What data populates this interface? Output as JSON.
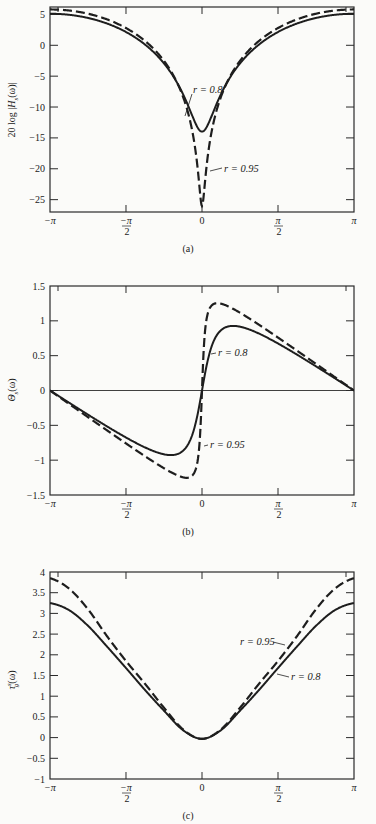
{
  "chart_data": [
    {
      "type": "line",
      "panel": "(a)",
      "title": "",
      "caption": "(a)",
      "xlabel": "",
      "ylabel": "20 log |H_s(ω)|",
      "ylabel_parts": {
        "pre": "20 log |",
        "main": "H",
        "sub": "s",
        "post": "(ω)|"
      },
      "xlim": [
        -3.14159,
        3.14159
      ],
      "ylim": [
        -27,
        6.2
      ],
      "xticks": [
        {
          "v": -3.14159,
          "label": "−π"
        },
        {
          "v": -1.5708,
          "label": "−π/2"
        },
        {
          "v": 0,
          "label": "0"
        },
        {
          "v": 1.5708,
          "label": "π/2"
        },
        {
          "v": 3.14159,
          "label": "π"
        }
      ],
      "yticks": [
        5,
        0,
        -5,
        -10,
        -15,
        -20,
        -25
      ],
      "ytick_labels": [
        "5",
        "0",
        "−5",
        "−10",
        "−15",
        "−20",
        "−25"
      ],
      "grid": false,
      "x": [
        "−π",
        "−7π/8",
        "−3π/4",
        "−5π/8",
        "−π/2",
        "−3π/8",
        "−π/4",
        "−π/8",
        "0",
        "π/8",
        "π/4",
        "3π/8",
        "π/2",
        "5π/8",
        "3π/4",
        "7π/8",
        "π"
      ],
      "series": [
        {
          "name": "r = 0.8",
          "style": "solid",
          "r": 0.8,
          "values": [
            5.11,
            4.94,
            4.43,
            3.53,
            2.15,
            0.12,
            -2.93,
            -7.9,
            -13.98,
            -7.9,
            -2.93,
            0.12,
            2.15,
            3.53,
            4.43,
            4.94,
            5.11
          ]
        },
        {
          "name": "r = 0.95",
          "style": "dashed",
          "r": 0.95,
          "values": [
            5.8,
            5.63,
            5.11,
            4.2,
            2.79,
            0.7,
            -2.53,
            -8.33,
            -26.02,
            -8.33,
            -2.53,
            0.7,
            2.79,
            4.2,
            5.11,
            5.63,
            5.8
          ]
        }
      ],
      "annotations": [
        {
          "text": "r = 0.8",
          "x": 193,
          "y": 93,
          "lx1": 192,
          "ly1": 94,
          "lx2": 185,
          "ly2": 116
        },
        {
          "text": "r = 0.95",
          "x": 224,
          "y": 172,
          "lx1": 222,
          "ly1": 168,
          "lx2": 210,
          "ly2": 171
        }
      ]
    },
    {
      "type": "line",
      "panel": "(b)",
      "title": "",
      "caption": "(b)",
      "xlabel": "",
      "ylabel": "Θ_s(ω)",
      "ylabel_parts": {
        "pre": "",
        "main": "Θ",
        "sub": "s",
        "post": "(ω)"
      },
      "xlim": [
        -3.14159,
        3.14159
      ],
      "ylim": [
        -1.5,
        1.5
      ],
      "xticks": [
        {
          "v": -3.14159,
          "label": "−π"
        },
        {
          "v": -1.5708,
          "label": "−π/2"
        },
        {
          "v": 0,
          "label": "0"
        },
        {
          "v": 1.5708,
          "label": "π/2"
        },
        {
          "v": 3.14159,
          "label": "π"
        }
      ],
      "yticks": [
        1.5,
        1,
        0.5,
        0,
        -0.5,
        -1,
        -1.5
      ],
      "ytick_labels": [
        "1.5",
        "1",
        "0.5",
        "0",
        "−0.5",
        "−1",
        "−1.5"
      ],
      "zero_line": true,
      "grid": false,
      "x": [
        "−π",
        "−7π/8",
        "−3π/4",
        "−5π/8",
        "−π/2",
        "−3π/8",
        "−π/4",
        "−π/8",
        "0",
        "π/8",
        "π/4",
        "3π/8",
        "π/2",
        "5π/8",
        "3π/4",
        "7π/8",
        "π"
      ],
      "series": [
        {
          "name": "r = 0.8",
          "style": "solid",
          "r": 0.8,
          "values": [
            0,
            -0.174,
            -0.347,
            -0.515,
            -0.675,
            -0.817,
            -0.916,
            -0.865,
            0,
            0.865,
            0.916,
            0.817,
            0.675,
            0.515,
            0.347,
            0.174,
            0
          ]
        },
        {
          "name": "r = 0.95",
          "style": "dashed",
          "r": 0.95,
          "values": [
            0,
            -0.191,
            -0.382,
            -0.572,
            -0.76,
            -0.944,
            -1.116,
            -1.246,
            0,
            1.246,
            1.116,
            0.944,
            0.76,
            0.572,
            0.382,
            0.191,
            0
          ]
        }
      ],
      "annotations": [
        {
          "text": "r = 0.8",
          "x": 218,
          "y": 356,
          "lx1": 216,
          "ly1": 353,
          "lx2": 211,
          "ly2": 354
        },
        {
          "text": "r = 0.95",
          "x": 210,
          "y": 448,
          "lx1": 208,
          "ly1": 445,
          "lx2": 204,
          "ly2": 446
        }
      ]
    },
    {
      "type": "line",
      "panel": "(c)",
      "title": "",
      "caption": "(c)",
      "xlabel": "",
      "ylabel": "τ_g^s(ω)",
      "ylabel_parts": {
        "pre": "",
        "main": "τ",
        "sub": "g",
        "sup": "s",
        "post": "(ω)"
      },
      "xlim": [
        -3.14159,
        3.14159
      ],
      "ylim": [
        -1,
        4
      ],
      "xticks": [
        {
          "v": -3.14159,
          "label": "−π"
        },
        {
          "v": -1.5708,
          "label": "−π/2"
        },
        {
          "v": 0,
          "label": "0"
        },
        {
          "v": 1.5708,
          "label": "π/2"
        },
        {
          "v": 3.14159,
          "label": "π"
        }
      ],
      "yticks": [
        4,
        3.5,
        3,
        2.5,
        2,
        1.5,
        1,
        0.5,
        0,
        -0.5,
        -1
      ],
      "ytick_labels": [
        "4",
        "3.5",
        "3",
        "2.5",
        "2",
        "1.5",
        "1",
        "0.5",
        "0",
        "−0.5",
        "−1"
      ],
      "grid": false,
      "x": [
        "−π",
        "−7π/8",
        "−3π/4",
        "−5π/8",
        "−π/2",
        "−3π/8",
        "−π/4",
        "−π/8",
        "0",
        "π/8",
        "π/4",
        "3π/8",
        "π/2",
        "5π/8",
        "3π/4",
        "7π/8",
        "π"
      ],
      "series": [
        {
          "name": "r = 0.8",
          "style": "solid",
          "r": 0.8,
          "values": [
            3.25,
            3.08,
            2.7,
            2.2,
            1.68,
            1.15,
            0.65,
            0.18,
            -0.03,
            0.18,
            0.65,
            1.15,
            1.68,
            2.2,
            2.7,
            3.08,
            3.25
          ]
        },
        {
          "name": "r = 0.95",
          "style": "dashed",
          "r": 0.95,
          "values": [
            3.85,
            3.6,
            3.1,
            2.45,
            1.85,
            1.3,
            0.72,
            0.2,
            -0.03,
            0.2,
            0.72,
            1.3,
            1.85,
            2.45,
            3.1,
            3.6,
            3.85
          ]
        }
      ],
      "annotations": [
        {
          "text": "r = 0.95",
          "x": 240,
          "y": 645,
          "lx1": 273,
          "ly1": 642,
          "lx2": 285,
          "ly2": 645
        },
        {
          "text": "r = 0.8",
          "x": 291,
          "y": 680,
          "lx1": 277,
          "ly1": 674,
          "lx2": 289,
          "ly2": 677
        }
      ]
    }
  ]
}
